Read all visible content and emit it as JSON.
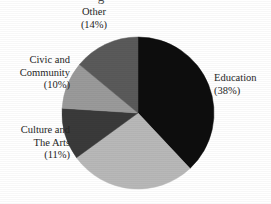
{
  "figure": {
    "title_partial": "g",
    "background_color": "#ffffff",
    "text_color": "#262626"
  },
  "chart_data": {
    "type": "pie",
    "title": "",
    "xlabel": "",
    "ylabel": "",
    "legend_position": "none",
    "grid": false,
    "start_angle_deg": 0,
    "direction": "clockwise",
    "center": {
      "x": 138,
      "y": 113
    },
    "radius": 76,
    "categories": [
      "Education",
      "Unlabeled",
      "Culture and The Arts",
      "Civic and Community",
      "Other"
    ],
    "values": [
      38,
      27,
      11,
      10,
      14
    ],
    "colors": [
      "#0d0d0d",
      "#b8b8b8",
      "#3a3a3a",
      "#9a9a9a",
      "#5a5a5a"
    ],
    "slices": [
      {
        "name": "Education",
        "value": 38,
        "percent_text": "(38%)",
        "color": "#0d0d0d",
        "label_lines": [
          "Education",
          "(38%)"
        ],
        "labeled": true
      },
      {
        "name": "Unlabeled",
        "value": 27,
        "percent_text": "",
        "color": "#b8b8b8",
        "label_lines": [],
        "labeled": false
      },
      {
        "name": "Culture and The Arts",
        "value": 11,
        "percent_text": "(11%)",
        "color": "#3a3a3a",
        "label_lines": [
          "Culture and",
          "The Arts",
          "(11%)"
        ],
        "labeled": true
      },
      {
        "name": "Civic and Community",
        "value": 10,
        "percent_text": "(10%)",
        "color": "#9a9a9a",
        "label_lines": [
          "Civic and",
          "Community",
          "(10%)"
        ],
        "labeled": true
      },
      {
        "name": "Other",
        "value": 14,
        "percent_text": "(14%)",
        "color": "#5a5a5a",
        "label_lines": [
          "Other",
          "(14%)"
        ],
        "labeled": true
      }
    ]
  },
  "labels": {
    "other": {
      "line1": "Other",
      "line2": "(14%)"
    },
    "civic": {
      "line1": "Civic and",
      "line2": "Community",
      "line3": "(10%)"
    },
    "culture": {
      "line1": "Culture and",
      "line2": "The Arts",
      "line3": "(11%)"
    },
    "education": {
      "line1": "Education",
      "line2": "(38%)"
    }
  }
}
